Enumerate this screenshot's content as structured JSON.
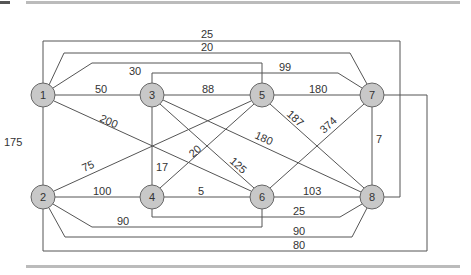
{
  "diagram": {
    "type": "weighted-graph",
    "node_fill": "#c8c8c8",
    "edge_color": "#555555",
    "nodes": [
      {
        "id": "1",
        "label": "1",
        "x": 43,
        "y": 95
      },
      {
        "id": "2",
        "label": "2",
        "x": 43,
        "y": 197
      },
      {
        "id": "3",
        "label": "3",
        "x": 152,
        "y": 95
      },
      {
        "id": "4",
        "label": "4",
        "x": 152,
        "y": 197
      },
      {
        "id": "5",
        "label": "5",
        "x": 262,
        "y": 95
      },
      {
        "id": "6",
        "label": "6",
        "x": 262,
        "y": 197
      },
      {
        "id": "7",
        "label": "7",
        "x": 372,
        "y": 95
      },
      {
        "id": "8",
        "label": "8",
        "x": 372,
        "y": 197
      }
    ],
    "edges": [
      {
        "from": "1",
        "to": "3",
        "weight": "50"
      },
      {
        "from": "3",
        "to": "5",
        "weight": "88"
      },
      {
        "from": "5",
        "to": "7",
        "weight": "180"
      },
      {
        "from": "1",
        "to": "2",
        "weight": "175"
      },
      {
        "from": "2",
        "to": "4",
        "weight": "100"
      },
      {
        "from": "4",
        "to": "6",
        "weight": "5"
      },
      {
        "from": "6",
        "to": "8",
        "weight": "103"
      },
      {
        "from": "7",
        "to": "8",
        "weight": "7"
      },
      {
        "from": "1",
        "to": "6",
        "weight": "200"
      },
      {
        "from": "2",
        "to": "5",
        "weight": "75"
      },
      {
        "from": "3",
        "to": "4",
        "weight": "17"
      },
      {
        "from": "4",
        "to": "5",
        "weight": "20"
      },
      {
        "from": "3",
        "to": "6",
        "weight": "125"
      },
      {
        "from": "3",
        "to": "8",
        "weight": "180"
      },
      {
        "from": "5",
        "to": "8",
        "weight": "187"
      },
      {
        "from": "6",
        "to": "7",
        "weight": "374"
      },
      {
        "from": "1",
        "to": "8",
        "weight": "25"
      },
      {
        "from": "1",
        "to": "7",
        "weight": "20"
      },
      {
        "from": "1",
        "to": "5",
        "weight": "30"
      },
      {
        "from": "3",
        "to": "7",
        "weight": "99"
      },
      {
        "from": "4",
        "to": "8",
        "weight": "25"
      },
      {
        "from": "2",
        "to": "6",
        "weight": "90"
      },
      {
        "from": "2",
        "to": "8",
        "weight": "90"
      },
      {
        "from": "2",
        "to": "7",
        "weight": "80"
      }
    ]
  }
}
